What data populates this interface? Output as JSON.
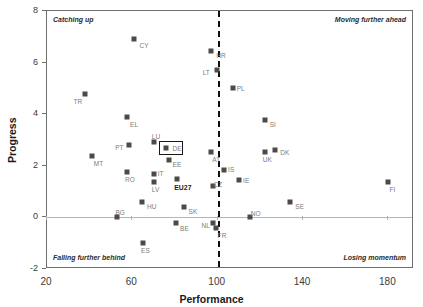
{
  "chart_data": {
    "type": "scatter",
    "title": "",
    "xlabel": "Performance",
    "ylabel": "Progress",
    "xlim": [
      20,
      192
    ],
    "ylim": [
      -2,
      8
    ],
    "xticks": [
      20,
      60,
      100,
      140,
      180
    ],
    "yticks": [
      -2,
      0,
      2,
      4,
      6,
      8
    ],
    "grid": false,
    "reference_lines": {
      "vertical_x": 100,
      "horizontal_y": 0
    },
    "quadrant_labels": {
      "top_left": "Catching up",
      "top_right": "Moving further ahead",
      "bottom_left": "Falling further behind",
      "bottom_right": "Losing momentum"
    },
    "highlighted_point": "DE",
    "points": [
      {
        "label": "CY",
        "x": 61,
        "y": 6.9,
        "lx": 5,
        "ly": 3
      },
      {
        "label": "HR",
        "x": 97,
        "y": 6.45,
        "lx": 5,
        "ly": 1
      },
      {
        "label": "LT",
        "x": 99.5,
        "y": 5.72,
        "lx": -14,
        "ly": -1
      },
      {
        "label": "PL",
        "x": 107,
        "y": 5.03,
        "lx": 4,
        "ly": -3
      },
      {
        "label": "TR",
        "x": 38,
        "y": 4.78,
        "lx": -12,
        "ly": 4
      },
      {
        "label": "EL",
        "x": 57.5,
        "y": 3.88,
        "lx": 3,
        "ly": 4
      },
      {
        "label": "SI",
        "x": 122,
        "y": 3.78,
        "lx": 5,
        "ly": 1
      },
      {
        "label": "LU",
        "x": 70,
        "y": 2.92,
        "lx": -2,
        "ly": -9
      },
      {
        "label": "DE",
        "x": 76,
        "y": 2.7,
        "lx": 6,
        "ly": -3
      },
      {
        "label": "PT",
        "x": 58.5,
        "y": 2.79,
        "lx": -14,
        "ly": -1
      },
      {
        "label": "DK",
        "x": 127,
        "y": 2.63,
        "lx": 5,
        "ly": -1
      },
      {
        "label": "AT",
        "x": 97,
        "y": 2.55,
        "lx": 1,
        "ly": 4
      },
      {
        "label": "UK",
        "x": 122,
        "y": 2.54,
        "lx": -2,
        "ly": 4
      },
      {
        "label": "MT",
        "x": 41,
        "y": 2.37,
        "lx": 2,
        "ly": 4
      },
      {
        "label": "EE",
        "x": 77,
        "y": 2.22,
        "lx": 4,
        "ly": 1
      },
      {
        "label": "IS",
        "x": 103,
        "y": 1.82,
        "lx": 4,
        "ly": -4
      },
      {
        "label": "RO",
        "x": 57.5,
        "y": 1.76,
        "lx": -2,
        "ly": 4
      },
      {
        "label": "IT",
        "x": 70,
        "y": 1.67,
        "lx": 4,
        "ly": -4
      },
      {
        "label": "IE",
        "x": 110,
        "y": 1.46,
        "lx": 4,
        "ly": -3
      },
      {
        "label": "EU27",
        "x": 81,
        "y": 1.48,
        "lx": -3,
        "ly": 5
      },
      {
        "label": "LV",
        "x": 70,
        "y": 1.38,
        "lx": -2,
        "ly": 4
      },
      {
        "label": "FI",
        "x": 180,
        "y": 1.36,
        "lx": 1,
        "ly": 4
      },
      {
        "label": "CZ",
        "x": 98,
        "y": 1.21,
        "lx": 0,
        "ly": -5
      },
      {
        "label": "HU",
        "x": 64.5,
        "y": 0.6,
        "lx": 5,
        "ly": 1
      },
      {
        "label": "SE",
        "x": 134,
        "y": 0.6,
        "lx": 5,
        "ly": 1
      },
      {
        "label": "SK",
        "x": 84,
        "y": 0.42,
        "lx": 5,
        "ly": 1
      },
      {
        "label": "BG",
        "x": 53,
        "y": 0.03,
        "lx": -2,
        "ly": -8
      },
      {
        "label": "NO",
        "x": 115,
        "y": 0.0,
        "lx": 1,
        "ly": -7
      },
      {
        "label": "BE",
        "x": 80.5,
        "y": -0.2,
        "lx": 4,
        "ly": 2
      },
      {
        "label": "NL",
        "x": 98,
        "y": -0.2,
        "lx": -12,
        "ly": -1
      },
      {
        "label": "FR",
        "x": 99,
        "y": -0.42,
        "lx": 2,
        "ly": 4
      },
      {
        "label": "ES",
        "x": 65,
        "y": -1.0,
        "lx": -2,
        "ly": 4
      }
    ]
  }
}
